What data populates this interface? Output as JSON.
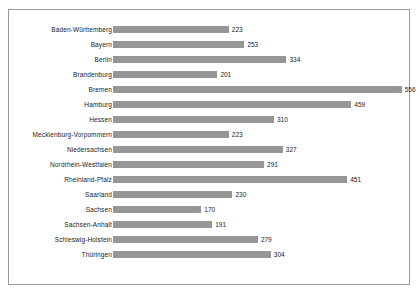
{
  "chart_data": {
    "type": "bar",
    "orientation": "horizontal",
    "title": "",
    "xlabel": "",
    "ylabel": "",
    "grid": false,
    "legend": "none",
    "xlim": [
      0,
      570
    ],
    "categories": [
      "Baden-Württemberg",
      "Bayern",
      "Berlin",
      "Brandenburg",
      "Bremen",
      "Hamburg",
      "Hessen",
      "Mecklenburg-Vorpommern",
      "Niedersachsen",
      "Nordrhein-Westfalen",
      "Rheinland-Pfalz",
      "Saarland",
      "Sachsen",
      "Sachsen-Anhalt",
      "Schleswig-Holstein",
      "Thüringen"
    ],
    "values": [
      223,
      253,
      334,
      201,
      556,
      459,
      310,
      223,
      327,
      291,
      451,
      230,
      170,
      191,
      279,
      304
    ],
    "value_labels": [
      "223",
      "253",
      "334",
      "201",
      "556",
      "459",
      "310",
      "223",
      "327",
      "291",
      "451",
      "230",
      "170",
      "191",
      "279",
      "304"
    ],
    "bar_color": "#969696",
    "frame_color": "#9a9a9a",
    "background_color": "#ffffff",
    "label_color": "#1a1a1a"
  }
}
